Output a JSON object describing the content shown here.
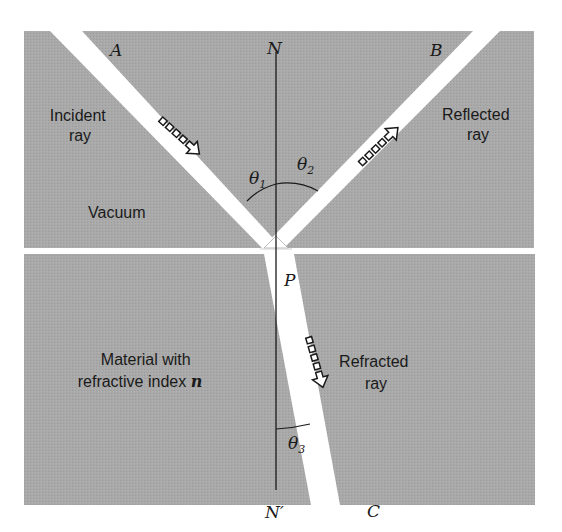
{
  "figure": {
    "colors": {
      "medium_gray": "#a6a6a6",
      "beam": "#ffffff",
      "line": "#1a1a1a",
      "background": "#ffffff"
    },
    "points": {
      "A": "A",
      "B": "B",
      "C": "C",
      "N": "N",
      "N_prime": "N′",
      "P": "P"
    },
    "angles": {
      "theta1": {
        "symbol": "θ",
        "subscript": "1"
      },
      "theta2": {
        "symbol": "θ",
        "subscript": "2"
      },
      "theta3": {
        "symbol": "θ",
        "subscript": "3"
      }
    },
    "labels": {
      "incident_line1": "Incident",
      "incident_line2": "ray",
      "reflected_line1": "Reflected",
      "reflected_line2": "ray",
      "vacuum": "Vacuum",
      "material_line1": "Material with",
      "material_line2_text": "refractive index ",
      "material_line2_symbol": "n",
      "refracted_line1": "Refracted",
      "refracted_line2": "ray"
    },
    "regions": [
      {
        "name": "Vacuum",
        "position": "upper"
      },
      {
        "name": "Material with refractive index n",
        "position": "lower"
      }
    ],
    "rays": [
      {
        "name": "Incident ray",
        "from": "A",
        "to": "P",
        "angle_label": "θ1"
      },
      {
        "name": "Reflected ray",
        "from": "P",
        "to": "B",
        "angle_label": "θ2"
      },
      {
        "name": "Refracted ray",
        "from": "P",
        "to": "C",
        "angle_label": "θ3"
      }
    ],
    "normal": {
      "from": "N",
      "to": "N′",
      "through": "P"
    }
  }
}
